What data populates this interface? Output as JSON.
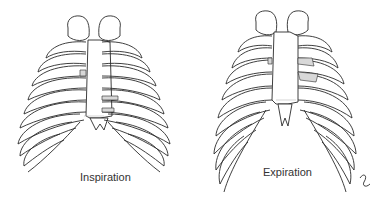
{
  "figure": {
    "left_panel": {
      "caption": "Inspiration",
      "subject": "rib cage (thorax) anterior view, expanded"
    },
    "right_panel": {
      "caption": "Expiration",
      "subject": "rib cage (thorax) anterior view, contracted"
    },
    "colors": {
      "line": "#2a2a2a",
      "cartilage_shading": "#d8d8d8",
      "background": "#ffffff"
    }
  }
}
